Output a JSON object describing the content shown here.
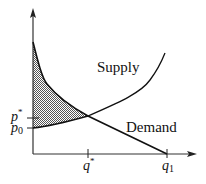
{
  "diagram": {
    "curves": {
      "supply_label": "Supply",
      "demand_label": "Demand"
    },
    "y_axis": {
      "ticks": [
        {
          "label": "p",
          "sup": "*",
          "y": 118
        },
        {
          "label": "p",
          "sub": "0",
          "y": 128
        }
      ]
    },
    "x_axis": {
      "ticks": [
        {
          "label": "q",
          "sup": "*",
          "x": 88
        },
        {
          "label": "q",
          "sub": "1",
          "x": 167
        }
      ]
    },
    "shading": {
      "description": "Region between demand curve (above) and supply curve (below), from q=0 to q*",
      "pattern": "dotted-gray"
    },
    "colors": {
      "line": "#111111",
      "fill_dark": "#555555",
      "fill_light": "#ffffff"
    }
  }
}
